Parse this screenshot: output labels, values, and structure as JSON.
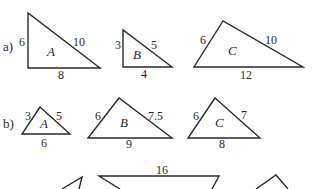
{
  "colors": {
    "ink": "#2a2a2a",
    "background": "#ffffff"
  },
  "parts": [
    {
      "label": "a)",
      "triangles": [
        {
          "name": "A",
          "sides": [
            "6",
            "10",
            "8"
          ]
        },
        {
          "name": "B",
          "sides": [
            "3",
            "5",
            "4"
          ]
        },
        {
          "name": "C",
          "sides": [
            "6",
            "10",
            "12"
          ]
        }
      ]
    },
    {
      "label": "b)",
      "triangles": [
        {
          "name": "A",
          "sides": [
            "3",
            "5",
            "6"
          ]
        },
        {
          "name": "B",
          "sides": [
            "6",
            "7.5",
            "9"
          ]
        },
        {
          "name": "C",
          "sides": [
            "6",
            "7",
            "8"
          ]
        }
      ]
    },
    {
      "label": "",
      "triangles": [
        {
          "name": "",
          "sides": []
        },
        {
          "name": "",
          "sides": [
            "16"
          ]
        },
        {
          "name": "",
          "sides": []
        }
      ]
    }
  ]
}
